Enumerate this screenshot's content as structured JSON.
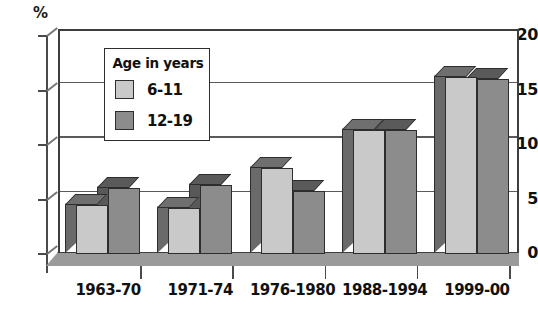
{
  "chart_data": {
    "type": "bar",
    "title": "",
    "subtitle": "",
    "xlabel": "",
    "ylabel": "%",
    "ylim": [
      0,
      20
    ],
    "yticks": [
      0,
      5,
      10,
      15,
      20
    ],
    "grid": true,
    "legend_position": "inside-top-left",
    "legend_title": "Age in years",
    "categories": [
      "1963-70",
      "1971-74",
      "1976-1980",
      "1988-1994",
      "1999-00"
    ],
    "series": [
      {
        "name": "6-11",
        "color": "#c9c9c9",
        "values": [
          4.5,
          4.2,
          7.9,
          11.4,
          16.2
        ]
      },
      {
        "name": "12-19",
        "color": "#8c8c8c",
        "values": [
          6.1,
          6.3,
          5.8,
          11.4,
          16.1
        ]
      }
    ]
  },
  "axis": {
    "unit_label": "%",
    "y_tick_labels": [
      "20",
      "15",
      "10",
      "5",
      "0"
    ],
    "x_tick_labels": [
      "1963-70",
      "1971-74",
      "1976-1980",
      "1988-1994",
      "1999-00"
    ]
  },
  "legend": {
    "title": "Age in years",
    "items": [
      {
        "label": "6-11",
        "color": "#c9c9c9"
      },
      {
        "label": "12-19",
        "color": "#8c8c8c"
      }
    ]
  }
}
